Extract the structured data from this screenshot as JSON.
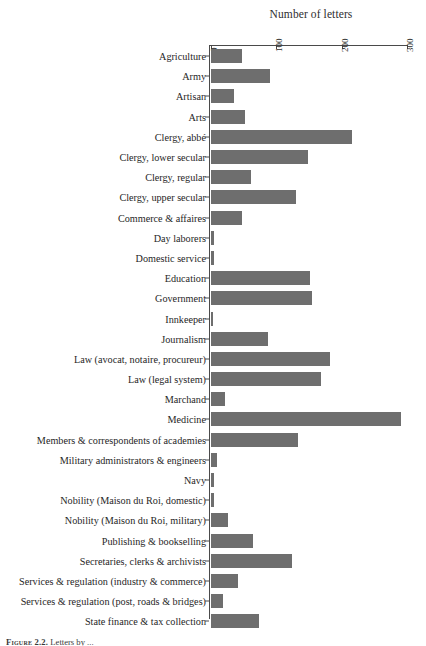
{
  "chart_data": {
    "type": "bar",
    "orientation": "horizontal",
    "title": "Number of letters",
    "xlabel": "Number of letters",
    "ylabel": "",
    "xlim": [
      0,
      300
    ],
    "xticks": [
      0,
      100,
      200,
      300
    ],
    "xtick_labels": [
      "0",
      "100",
      "200",
      "300"
    ],
    "grid": false,
    "legend": false,
    "bar_color": "#6e6e6e",
    "axis_color": "#4a4a4a",
    "categories": [
      "Agriculture",
      "Army",
      "Artisan",
      "Arts",
      "Clergy, abbé",
      "Clergy, lower secular",
      "Clergy, regular",
      "Clergy, upper secular",
      "Commerce & affaires",
      "Day laborers",
      "Domestic service",
      "Education",
      "Government",
      "Innkeeper",
      "Journalism",
      "Law (avocat, notaire, procureur)",
      "Law (legal system)",
      "Marchand",
      "Medicine",
      "Members & correspondents of academies",
      "Military administrators & engineers",
      "Navy",
      "Nobility (Maison du Roi, domestic)",
      "Nobility (Maison du Roi, military)",
      "Publishing & bookselling",
      "Secretaries, clerks & archivists",
      "Services & regulation (industry & commerce)",
      "Services & regulation (post, roads & bridges)",
      "State finance & tax collection"
    ],
    "values": [
      47,
      90,
      35,
      52,
      216,
      148,
      61,
      130,
      47,
      4,
      4,
      151,
      154,
      2,
      87,
      182,
      169,
      22,
      291,
      133,
      9,
      4,
      5,
      26,
      64,
      124,
      41,
      19,
      73
    ]
  },
  "caption": {
    "figure_number": "Figure 2.2.",
    "text": "Letters by ... "
  }
}
